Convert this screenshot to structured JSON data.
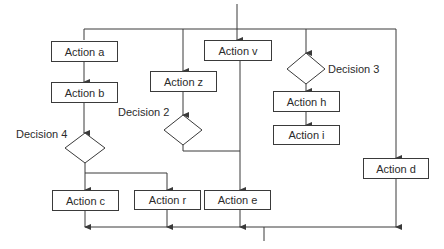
{
  "diagram": {
    "type": "flowchart",
    "line_color": "#3a3a3a",
    "text_color": "#2b2b2b",
    "background": "#ffffff",
    "actions": {
      "a": "Action a",
      "b": "Action b",
      "c": "Action c",
      "r": "Action r",
      "z": "Action z",
      "v": "Action v",
      "e": "Action e",
      "h": "Action h",
      "i": "Action i",
      "d": "Action d"
    },
    "decisions": {
      "d2": "Decision 2",
      "d3": "Decision 3",
      "d4": "Decision 4"
    }
  }
}
